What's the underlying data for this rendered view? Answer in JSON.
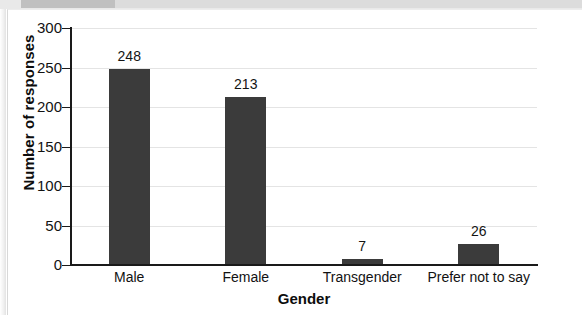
{
  "chart_data": {
    "type": "bar",
    "title": "",
    "xlabel": "Gender",
    "ylabel": "Number of responses",
    "categories": [
      "Male",
      "Female",
      "Transgender",
      "Prefer not to say"
    ],
    "values": [
      248,
      213,
      7,
      26
    ],
    "value_labels": [
      "248",
      "213",
      "7",
      "26"
    ],
    "ylim": [
      0,
      300
    ],
    "yticks": [
      0,
      50,
      100,
      150,
      200,
      250,
      300
    ],
    "ytick_labels": [
      "0",
      "50",
      "100",
      "150",
      "200",
      "250",
      "300"
    ],
    "grid": true,
    "legend": "none",
    "bar_color": "#3b3b3b",
    "gridline_color": "#e4e4e4",
    "axis_color": "#1a1a1a",
    "background_color": "#ffffff"
  }
}
